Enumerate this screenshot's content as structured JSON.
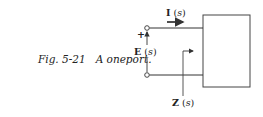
{
  "caption": {
    "figure_number": "Fig. 5-21",
    "title": "A oneport."
  },
  "diagram": {
    "current_label": {
      "symbol": "I",
      "arg": "s"
    },
    "voltage_label": {
      "symbol": "E",
      "arg": "s"
    },
    "impedance_label": {
      "symbol": "Z",
      "arg": "s"
    },
    "polarity_plus": "+",
    "stroke_color": "#333333"
  }
}
